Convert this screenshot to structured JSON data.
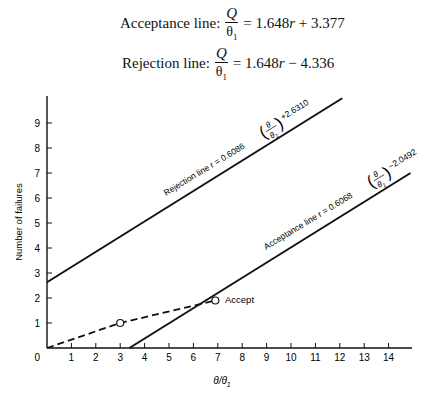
{
  "equations": {
    "acceptance": {
      "label": "Acceptance line:",
      "num": "Q",
      "den": "θ",
      "den_sub": "1",
      "rhs_pre": "= 1.648",
      "var": "r",
      "rhs_post": " + 3.377"
    },
    "rejection": {
      "label": "Rejection line:",
      "num": "Q",
      "den": "θ",
      "den_sub": "1",
      "rhs_pre": "= 1.648",
      "var": "r",
      "rhs_post": " − 4.336"
    }
  },
  "chart_data": {
    "type": "line",
    "title": "",
    "xlabel": "θ/θ1",
    "ylabel": "Number of failures",
    "xlim": [
      0,
      15
    ],
    "ylim": [
      0,
      10
    ],
    "x_ticks": [
      0,
      1,
      2,
      3,
      4,
      5,
      6,
      7,
      8,
      9,
      10,
      11,
      12,
      13,
      14
    ],
    "y_ticks": [
      1,
      2,
      3,
      4,
      5,
      6,
      7,
      8,
      9
    ],
    "grid": false,
    "series": [
      {
        "name": "Rejection line",
        "label": "Rejection line r = 0.6086 (θ/θ1) +2.6310",
        "slope": 0.6086,
        "intercept": 2.631,
        "points": [
          [
            0,
            2.631
          ],
          [
            12.1,
            9.99
          ]
        ],
        "style": "solid"
      },
      {
        "name": "Acceptance line",
        "label": "Acceptance line r = 0.6068 (θ/θ1) −2.0492",
        "slope": 0.6068,
        "intercept": -2.0492,
        "points": [
          [
            3.377,
            0
          ],
          [
            14.9,
            7.0
          ]
        ],
        "style": "solid"
      },
      {
        "name": "Test path",
        "points": [
          [
            0,
            0
          ],
          [
            3,
            1
          ],
          [
            6.9,
            1.9
          ]
        ],
        "markers": [
          [
            3,
            1
          ],
          [
            6.9,
            1.9
          ]
        ],
        "style": "dashed"
      }
    ],
    "annotations": [
      {
        "text": "Accept",
        "x": 6.9,
        "y": 1.9
      }
    ]
  },
  "labels": {
    "rejection_prefix": "Rejection line r = 0.6086",
    "rejection_suffix": "+2.6310",
    "acceptance_prefix": "Acceptance line r = 0.6068",
    "acceptance_suffix": "−2.0492",
    "theta": "θ",
    "theta1": "θ",
    "sub1": "1",
    "accept": "Accept",
    "ylabel": "Number of failures",
    "xlabel": "θ/θ",
    "xlabel_sub": "1",
    "origin": "0"
  }
}
